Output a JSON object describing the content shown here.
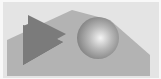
{
  "image": {
    "description": "Rendered scene with a gray mountain-like polygon, a dark gray triangle and a shaded sphere",
    "colors": {
      "background": "#e4e4e4",
      "frame": "#f8f8f8",
      "polygon": "#b3b3b3",
      "triangle": "#7b7b7b",
      "triangle_shadow": "#6e6e6e",
      "sphere_highlight": "#f4f4f4",
      "sphere_mid": "#b8b8b8",
      "sphere_edge": "#7a7a7a"
    },
    "objects": [
      {
        "name": "background-plane",
        "shape": "rectangle"
      },
      {
        "name": "gray-polygon",
        "shape": "polygon"
      },
      {
        "name": "dark-triangle",
        "shape": "triangle"
      },
      {
        "name": "shaded-sphere",
        "shape": "sphere"
      }
    ]
  }
}
